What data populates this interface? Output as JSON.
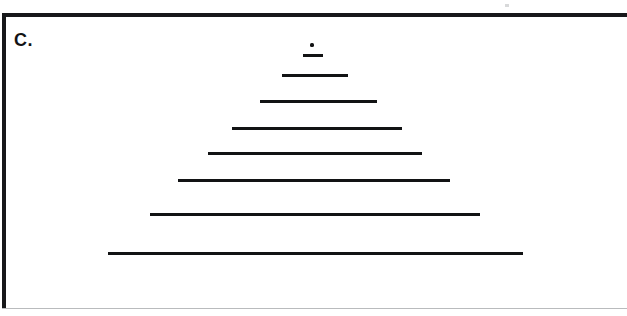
{
  "figure": {
    "panel_label": "C.",
    "background_color": "#ffffff",
    "ink_color": "#121314",
    "border_color": "#17181a",
    "caption_note": ""
  },
  "chart_data": {
    "type": "bar",
    "title": "C.",
    "subtitle": "",
    "xlabel": "",
    "ylabel": "",
    "orientation": "horizontal",
    "grid": false,
    "legend": null,
    "axis_visible": false,
    "units": "px",
    "categories": [
      "1",
      "2",
      "3",
      "4",
      "5",
      "6",
      "7",
      "8",
      "9"
    ],
    "values": [
      3,
      20,
      66,
      117,
      170,
      214,
      272,
      330,
      415
    ],
    "xlim": [
      0,
      627
    ],
    "ylim": [
      0,
      316
    ],
    "marks": [
      {
        "id": "dot",
        "kind": "dot",
        "x": 310,
        "y": 43,
        "width": 4,
        "height": 4,
        "center_x": 312,
        "length": 4
      },
      {
        "id": "line-1",
        "kind": "line",
        "x": 303,
        "y": 54,
        "width": 20,
        "height": 3,
        "center_x": 313,
        "length": 20
      },
      {
        "id": "line-2",
        "kind": "line",
        "x": 282,
        "y": 74,
        "width": 66,
        "height": 3,
        "center_x": 315,
        "length": 66
      },
      {
        "id": "line-3",
        "kind": "line",
        "x": 260,
        "y": 100,
        "width": 117,
        "height": 3,
        "center_x": 318,
        "length": 117
      },
      {
        "id": "line-4",
        "kind": "line",
        "x": 232,
        "y": 127,
        "width": 170,
        "height": 3,
        "center_x": 317,
        "length": 170
      },
      {
        "id": "line-5",
        "kind": "line",
        "x": 208,
        "y": 152,
        "width": 214,
        "height": 3,
        "center_x": 315,
        "length": 214
      },
      {
        "id": "line-6",
        "kind": "line",
        "x": 178,
        "y": 179,
        "width": 272,
        "height": 3,
        "center_x": 314,
        "length": 272
      },
      {
        "id": "line-7",
        "kind": "line",
        "x": 150,
        "y": 213,
        "width": 330,
        "height": 3,
        "center_x": 315,
        "length": 330
      },
      {
        "id": "line-8",
        "kind": "line",
        "x": 108,
        "y": 252,
        "width": 415,
        "height": 3,
        "center_x": 315,
        "length": 415
      }
    ]
  }
}
